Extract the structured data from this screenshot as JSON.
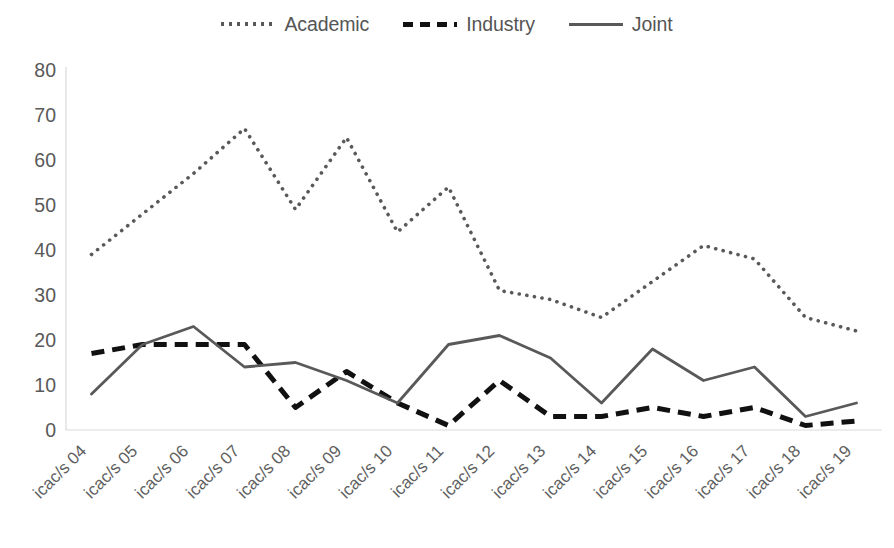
{
  "chart_data": {
    "type": "line",
    "title": "",
    "xlabel": "",
    "ylabel": "",
    "ylim": [
      0,
      80
    ],
    "ytick_step": 10,
    "yticks": [
      "0",
      "10",
      "20",
      "30",
      "40",
      "50",
      "60",
      "70",
      "80"
    ],
    "grid": false,
    "legend_position": "top-center",
    "categories": [
      "icac/s 04",
      "icac/s 05",
      "icac/s 06",
      "icac/s 07",
      "icac/s 08",
      "icac/s 09",
      "icac/s 10",
      "icac/s 11",
      "icac/s 12",
      "icac/s 13",
      "icac/s 14",
      "icac/s 15",
      "icac/s 16",
      "icac/s 17",
      "icac/s 18",
      "icac/s 19"
    ],
    "series": [
      {
        "name": "Academic",
        "style": "dotted",
        "color": "#595959",
        "values": [
          39,
          48,
          57,
          67,
          49,
          65,
          44,
          54,
          31,
          29,
          25,
          33,
          41,
          38,
          25,
          22
        ]
      },
      {
        "name": "Industry",
        "style": "dashed",
        "color": "#111111",
        "values": [
          17,
          19,
          19,
          19,
          5,
          13,
          6,
          1,
          11,
          3,
          3,
          5,
          3,
          5,
          1,
          2
        ]
      },
      {
        "name": "Joint",
        "style": "solid",
        "color": "#595959",
        "values": [
          8,
          19,
          23,
          14,
          15,
          11,
          6,
          19,
          21,
          16,
          6,
          18,
          11,
          14,
          3,
          6
        ]
      }
    ]
  },
  "legend": {
    "items": [
      {
        "label": "Academic",
        "swatch": "dotted-line-swatch"
      },
      {
        "label": "Industry",
        "swatch": "dashed-line-swatch"
      },
      {
        "label": "Joint",
        "swatch": "solid-line-swatch"
      }
    ]
  }
}
